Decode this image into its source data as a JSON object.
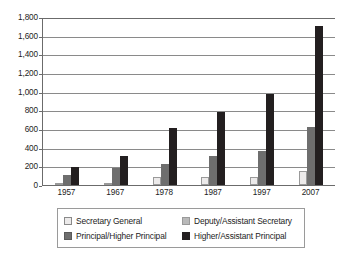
{
  "chart_data": {
    "type": "bar",
    "title": "",
    "subtitle": "",
    "xlabel": "",
    "ylabel": "",
    "categories": [
      "1957",
      "1967",
      "1978",
      "1987",
      "1997",
      "2007"
    ],
    "ylim": [
      0,
      1800
    ],
    "yticks": [
      0,
      200,
      400,
      600,
      800,
      1000,
      1200,
      1400,
      1600,
      1800
    ],
    "ytick_labels": [
      "0",
      "200",
      "400",
      "600",
      "800",
      "1,000",
      "1,200",
      "1,400",
      "1,600",
      "1,800"
    ],
    "grid": true,
    "legend_position": "bottom",
    "series": [
      {
        "name": "Secretary General",
        "color": "#eceaea",
        "values": [
          10,
          15,
          85,
          85,
          90,
          145
        ]
      },
      {
        "name": "Deputy/Assistant Secretary",
        "color": "#b9b9b9",
        "values": [
          0,
          0,
          0,
          0,
          0,
          0
        ]
      },
      {
        "name": "Principal/Higher Principal",
        "color": "#6e6e6e",
        "values": [
          110,
          180,
          225,
          310,
          365,
          620
        ]
      },
      {
        "name": "Higher/Assistant Principal",
        "color": "#231f20",
        "values": [
          195,
          310,
          610,
          780,
          980,
          1700
        ]
      }
    ]
  },
  "legend": {
    "items": [
      {
        "label": "Secretary General",
        "swatch": "sw0"
      },
      {
        "label": "Deputy/Assistant Secretary",
        "swatch": "sw1"
      },
      {
        "label": "Principal/Higher Principal",
        "swatch": "sw2"
      },
      {
        "label": "Higher/Assistant Principal",
        "swatch": "sw3"
      }
    ]
  }
}
